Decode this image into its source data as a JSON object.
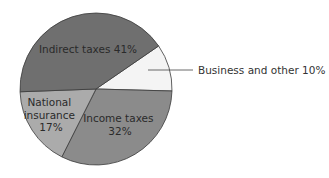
{
  "chart_data": {
    "type": "pie",
    "title": "",
    "start_angle_deg": -34.5,
    "direction": "clockwise",
    "slices": [
      {
        "name": "Business and other",
        "value": 10,
        "label": "Business and other 10%",
        "color": "#f4f4f4",
        "label_mode": "callout"
      },
      {
        "name": "Income taxes",
        "value": 32,
        "label_lines": [
          "Income taxes",
          "32%"
        ],
        "color": "#8b8b8b",
        "label_mode": "inside"
      },
      {
        "name": "National insurance",
        "value": 17,
        "label_lines": [
          "National",
          "insurance",
          "17%"
        ],
        "color": "#ababab",
        "label_mode": "inside"
      },
      {
        "name": "Indirect taxes",
        "value": 41,
        "label_lines": [
          "Indirect taxes 41%"
        ],
        "color": "#6f6f6f",
        "label_mode": "inside"
      }
    ],
    "legend": "none"
  }
}
